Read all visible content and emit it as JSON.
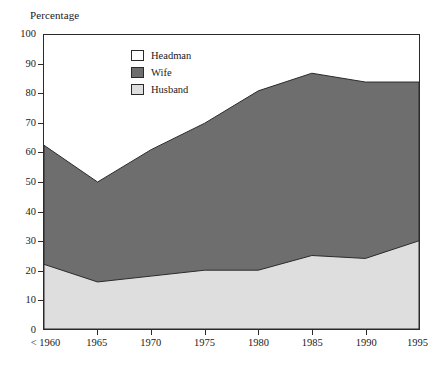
{
  "chart_data": {
    "type": "area",
    "stacked": true,
    "title": "",
    "xlabel": "",
    "ylabel": "Percentage",
    "ylim": [
      0,
      100
    ],
    "ytick_step": 10,
    "yticks": [
      0,
      10,
      20,
      30,
      40,
      50,
      60,
      70,
      80,
      90,
      100
    ],
    "grid": false,
    "legend_position": "inside-top-left",
    "categories": [
      "< 1960",
      "1965",
      "1970",
      "1975",
      "1980",
      "1985",
      "1990",
      "1995"
    ],
    "series": [
      {
        "name": "Husband",
        "color": "#dedede",
        "stack_order": 1,
        "values": [
          22,
          16,
          18,
          20,
          20,
          25,
          24,
          30
        ]
      },
      {
        "name": "Wife",
        "color": "#6e6e6e",
        "stack_order": 2,
        "values": [
          40.5,
          34,
          43,
          50,
          61,
          62,
          60,
          54
        ]
      },
      {
        "name": "Headman",
        "color": "#ffffff",
        "stack_order": 3,
        "values": [
          37.5,
          50,
          39,
          30,
          19,
          13,
          16,
          16
        ]
      }
    ],
    "cumulative_tops": {
      "husband": [
        22,
        16,
        18,
        20,
        20,
        25,
        24,
        30
      ],
      "husband_plus_wife": [
        62.5,
        50,
        61,
        70,
        81,
        87,
        84,
        84
      ],
      "total": [
        100,
        100,
        100,
        100,
        100,
        100,
        100,
        100
      ]
    }
  },
  "legend": {
    "items": [
      {
        "label": "Headman",
        "color": "#ffffff"
      },
      {
        "label": "Wife",
        "color": "#6e6e6e"
      },
      {
        "label": "Husband",
        "color": "#dedede"
      }
    ]
  },
  "axes": {
    "y_title": "Percentage",
    "y_ticklabels": [
      "100",
      "90",
      "80",
      "70",
      "60",
      "50",
      "40",
      "30",
      "20",
      "10",
      "0"
    ],
    "x_ticklabels": [
      "< 1960",
      "1965",
      "1970",
      "1975",
      "1980",
      "1985",
      "1990",
      "1995"
    ]
  },
  "colors": {
    "frame": "#2a2a2a",
    "headman": "#ffffff",
    "wife": "#6e6e6e",
    "husband": "#dedede",
    "background": "#ffffff"
  }
}
